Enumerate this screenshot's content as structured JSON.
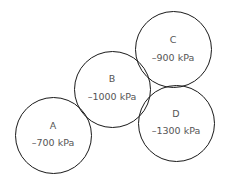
{
  "diagram": {
    "title": "",
    "cells": [
      {
        "id": "A",
        "label": "A",
        "pressure": "–700 kPa",
        "cx": 53,
        "cy": 135,
        "r": 38
      },
      {
        "id": "B",
        "label": "B",
        "pressure": "–1000 kPa",
        "cx": 112,
        "cy": 89,
        "r": 38
      },
      {
        "id": "C",
        "label": "C",
        "pressure": "–900 kPa",
        "cx": 173,
        "cy": 49,
        "r": 38
      },
      {
        "id": "D",
        "label": "D",
        "pressure": "–1300 kPa",
        "cx": 176,
        "cy": 123,
        "r": 38
      }
    ],
    "stroke_color": "#1a1a1a",
    "text_color": "#555555"
  }
}
